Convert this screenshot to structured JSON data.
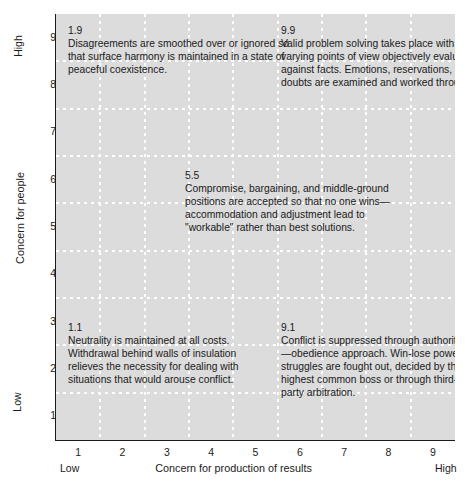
{
  "chart_data": {
    "type": "scatter",
    "title": "",
    "xlabel": "Concern for production of results",
    "ylabel": "Concern for people",
    "xlim": [
      0.5,
      9.5
    ],
    "ylim": [
      0.5,
      9.5
    ],
    "grid": true,
    "legend": null,
    "xticks": [
      "1",
      "2",
      "3",
      "4",
      "5",
      "6",
      "7",
      "8",
      "9"
    ],
    "yticks": [
      "1",
      "2",
      "3",
      "4",
      "5",
      "6",
      "7",
      "8",
      "9"
    ],
    "x_low_label": "Low",
    "x_high_label": "High",
    "y_low_label": "Low",
    "y_high_label": "High",
    "background_color": "#dcdcdc",
    "gridline_color": "#ffffff",
    "text_color": "#1a1a1a",
    "annotations": [
      {
        "code": "1.9",
        "x": 1,
        "y": 9,
        "text": "Disagreements are smoothed over or ignored so that surface harmony is maintained in a state of peaceful coexistence."
      },
      {
        "code": "9.9",
        "x": 9,
        "y": 9,
        "text": "Valid problem solving takes place with varying points of view objectively evaluated against facts. Emotions, reservations, and doubts are examined and worked through."
      },
      {
        "code": "5.5",
        "x": 5,
        "y": 5,
        "text": "Compromise, bargaining, and middle-ground positions are accepted so that no one wins—accommodation and adjustment lead to \"workable\" rather than best solutions."
      },
      {
        "code": "1.1",
        "x": 1,
        "y": 1,
        "text": "Neutrality is maintained at all costs. Withdrawal behind walls of insulation relieves the necessity for dealing with situations that would arouse conflict."
      },
      {
        "code": "9.1",
        "x": 9,
        "y": 1,
        "text": "Conflict is suppressed through authority—obedience approach. Win-lose power struggles are fought out, decided by the highest common boss or through third-party arbitration."
      }
    ]
  }
}
